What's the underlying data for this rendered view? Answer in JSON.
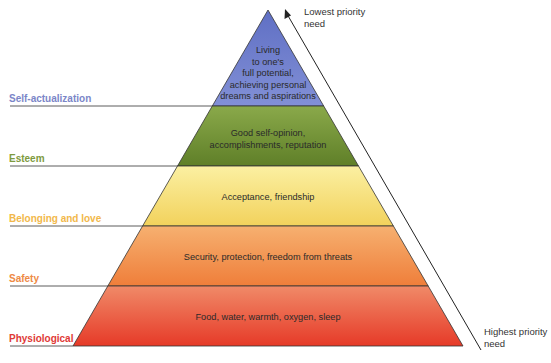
{
  "diagram": {
    "type": "pyramid",
    "levels": [
      {
        "name": "Self-actualization",
        "description": "Living to one's full potential, achieving personal dreams and aspirations",
        "description_lines": [
          "Living",
          "to one's",
          "full potential,",
          "achieving personal",
          "dreams and aspirations"
        ],
        "label_color": "#7b86c8",
        "fill": "#6a78c8"
      },
      {
        "name": "Esteem",
        "description": "Good self-opinion, accomplishments, reputation",
        "description_lines": [
          "Good self-opinion,",
          "accomplishments, reputation"
        ],
        "label_color": "#7e9a3e",
        "fill": "#7e9c3e"
      },
      {
        "name": "Belonging and love",
        "description": "Acceptance, friendship",
        "description_lines": [
          "Acceptance, friendship"
        ],
        "label_color": "#f2b84a",
        "fill": "#f6e27e"
      },
      {
        "name": "Safety",
        "description": "Security, protection, freedom from threats",
        "description_lines": [
          "Security, protection, freedom from threats"
        ],
        "label_color": "#ee8a45",
        "fill": "#f29a50"
      },
      {
        "name": "Physiological",
        "description": "Food, water, warmth, oxygen, sleep",
        "description_lines": [
          "Food, water, warmth, oxygen, sleep"
        ],
        "label_color": "#e03a36",
        "fill": "#ec5a3e"
      }
    ],
    "arrow": {
      "top_label_lines": [
        "Lowest priority",
        "need"
      ],
      "bottom_label_lines": [
        "Highest priority",
        "need"
      ]
    }
  }
}
